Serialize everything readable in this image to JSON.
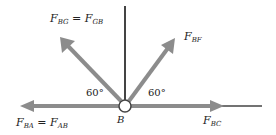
{
  "diagram": {
    "joint": {
      "label": "B"
    },
    "forces": [
      {
        "id": "bg",
        "label_main": "F",
        "sub1": "BG",
        "eq": " = ",
        "label_main2": "F",
        "sub2": "GB",
        "direction": "up-left",
        "angle_deg": 60
      },
      {
        "id": "bf",
        "label_main": "F",
        "sub1": "BF",
        "direction": "up-right",
        "angle_deg": 60
      },
      {
        "id": "ba",
        "label_main": "F",
        "sub1": "BA",
        "eq": " = ",
        "label_main2": "F",
        "sub2": "AB",
        "direction": "left"
      },
      {
        "id": "bc",
        "label_main": "F",
        "sub1": "BC",
        "direction": "right"
      }
    ],
    "angles": [
      {
        "id": "left",
        "text": "60°"
      },
      {
        "id": "right",
        "text": "60°"
      }
    ],
    "colors": {
      "arrow": "#8c8c8c",
      "member": "#444444",
      "text": "#222222"
    }
  }
}
